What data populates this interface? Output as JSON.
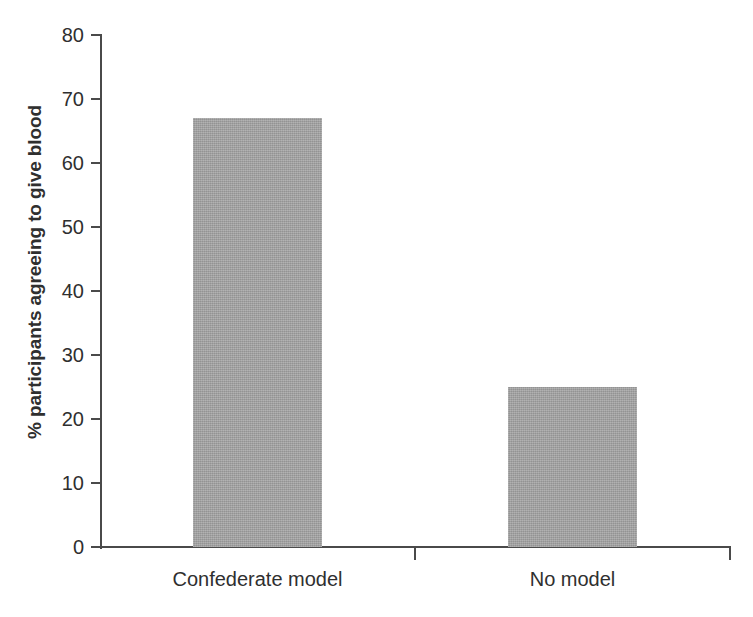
{
  "chart_data": {
    "type": "bar",
    "title": "",
    "subtitle": "",
    "xlabel": "",
    "ylabel": "% participants agreeing to give blood",
    "categories": [
      "Confederate model",
      "No model"
    ],
    "values": [
      67,
      25
    ],
    "series": [
      {
        "name": "% participants agreeing to give blood",
        "values": [
          67,
          25
        ]
      }
    ],
    "ylim": [
      0,
      80
    ],
    "ytick_labels": [
      "0",
      "10",
      "20",
      "30",
      "40",
      "50",
      "60",
      "70",
      "80"
    ],
    "ytick_values": [
      0,
      10,
      20,
      30,
      40,
      50,
      60,
      70,
      80
    ],
    "ytick_step": 10,
    "grid": false,
    "legend": null,
    "legend_position": "none",
    "annotations": [],
    "bar_color": "#a2a2a2",
    "axis_color": "#4a4a4a",
    "text_color": "#2f2f2f",
    "background_color": "#ffffff"
  }
}
